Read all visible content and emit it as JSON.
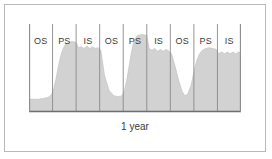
{
  "figure": {
    "axis_caption": "1 year",
    "frame_color": "#b9b9b9",
    "background_color": "#ffffff"
  },
  "phases": [
    {
      "label": "OS"
    },
    {
      "label": "PS"
    },
    {
      "label": "IS"
    },
    {
      "label": "OS"
    },
    {
      "label": "PS"
    },
    {
      "label": "IS"
    },
    {
      "label": "OS"
    },
    {
      "label": "PS"
    },
    {
      "label": "IS"
    }
  ],
  "chart_data": {
    "type": "area",
    "title": "",
    "subtitle": "",
    "xlabel": "1 year",
    "ylabel": "",
    "grid": false,
    "legend": null,
    "annotations": [
      {
        "text": "1 year",
        "position": "below-x-axis",
        "role": "axis-span-caption"
      }
    ],
    "axis": {
      "x_range": [
        0,
        9
      ],
      "y_range": [
        0,
        1
      ],
      "x_tick_labels": [
        "OS",
        "PS",
        "IS",
        "OS",
        "PS",
        "IS",
        "OS",
        "PS",
        "IS"
      ],
      "x_tick_style": "vertical-divider-lines",
      "y_tick_labels": [],
      "baseline_visible": true,
      "baseline_color": "#6e6e6e",
      "divider_color": "#8a8a8a"
    },
    "series": [
      {
        "name": "activity",
        "fill_color": "#d2d2d2",
        "line_color": "#bdbdbd",
        "x": [
          0.0,
          0.2,
          0.4,
          0.6,
          0.8,
          0.95,
          1.05,
          1.15,
          1.25,
          1.35,
          1.45,
          1.55,
          1.7,
          1.85,
          2.0,
          2.1,
          2.22,
          2.34,
          2.46,
          2.58,
          2.7,
          2.82,
          2.94,
          3.05,
          3.2,
          3.4,
          3.6,
          3.8,
          3.95,
          4.05,
          4.15,
          4.25,
          4.35,
          4.45,
          4.6,
          4.8,
          5.0,
          5.1,
          5.22,
          5.34,
          5.46,
          5.58,
          5.7,
          5.82,
          5.94,
          6.05,
          6.2,
          6.35,
          6.5,
          6.62,
          6.74,
          6.88,
          7.0,
          7.12,
          7.24,
          7.36,
          7.5,
          7.65,
          7.8,
          7.95,
          8.05,
          8.18,
          8.3,
          8.42,
          8.54,
          8.66,
          8.78,
          8.9,
          9.0
        ],
        "y": [
          0.14,
          0.14,
          0.14,
          0.15,
          0.16,
          0.19,
          0.26,
          0.38,
          0.52,
          0.64,
          0.72,
          0.77,
          0.79,
          0.8,
          0.79,
          0.73,
          0.74,
          0.72,
          0.75,
          0.72,
          0.74,
          0.72,
          0.73,
          0.7,
          0.42,
          0.24,
          0.18,
          0.17,
          0.18,
          0.24,
          0.36,
          0.52,
          0.68,
          0.8,
          0.87,
          0.88,
          0.87,
          0.72,
          0.7,
          0.72,
          0.69,
          0.71,
          0.69,
          0.71,
          0.69,
          0.66,
          0.52,
          0.36,
          0.23,
          0.18,
          0.2,
          0.3,
          0.45,
          0.58,
          0.66,
          0.7,
          0.72,
          0.73,
          0.72,
          0.71,
          0.66,
          0.68,
          0.66,
          0.68,
          0.66,
          0.68,
          0.66,
          0.68,
          0.67
        ],
        "description": "Cyclic activity rising through PS, plateauing across IS, declining through OS, repeated three times over one year"
      }
    ]
  }
}
